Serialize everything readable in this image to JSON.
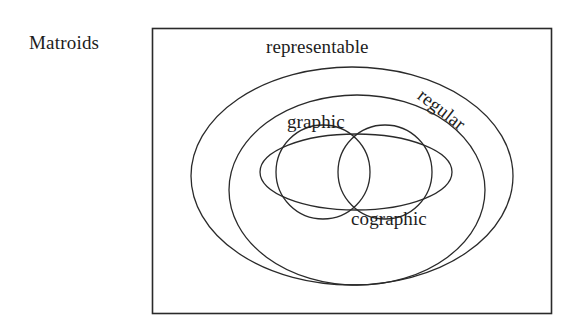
{
  "figure": {
    "caption_label": "Matroids",
    "frame": {
      "x": 152,
      "y": 28,
      "width": 399,
      "height": 285,
      "stroke_color": "#2a2a2a"
    }
  },
  "sets": [
    {
      "id": "representable",
      "label": "representable",
      "shape": "ellipse",
      "cx": 352,
      "cy": 176,
      "rx": 161,
      "ry": 109,
      "stroke_color": "#2a2a2a"
    },
    {
      "id": "regular",
      "label": "regular",
      "shape": "ellipse",
      "cx": 357,
      "cy": 190,
      "rx": 128,
      "ry": 95,
      "stroke_color": "#2a2a2a",
      "label_rotation_deg": 38
    },
    {
      "id": "graphic",
      "label": "graphic",
      "shape": "circle",
      "cx": 323,
      "cy": 172,
      "r": 47,
      "stroke_color": "#2a2a2a"
    },
    {
      "id": "cographic",
      "label": "cographic",
      "shape": "circle",
      "cx": 385,
      "cy": 172,
      "r": 47,
      "stroke_color": "#2a2a2a"
    }
  ],
  "inner_ellipse": {
    "id": "graphic-cographic-enclosure",
    "shape": "ellipse",
    "cx": 356,
    "cy": 172,
    "rx": 96,
    "ry": 38,
    "stroke_color": "#2a2a2a"
  },
  "colors": {
    "stroke": "#2a2a2a",
    "text": "#1d1d1d",
    "background": "#ffffff"
  }
}
